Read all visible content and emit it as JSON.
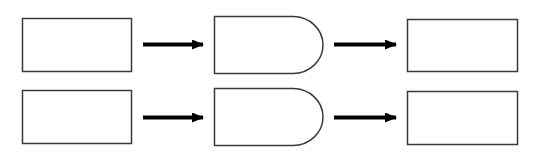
{
  "diagram": {
    "type": "flow",
    "rows": [
      {
        "nodes": [
          {
            "shape": "rectangle",
            "label": ""
          },
          {
            "shape": "delay",
            "label": ""
          },
          {
            "shape": "rectangle",
            "label": ""
          }
        ],
        "edges": [
          {
            "from": 0,
            "to": 1,
            "style": "arrow"
          },
          {
            "from": 1,
            "to": 2,
            "style": "arrow"
          }
        ]
      },
      {
        "nodes": [
          {
            "shape": "rectangle",
            "label": ""
          },
          {
            "shape": "delay",
            "label": ""
          },
          {
            "shape": "rectangle",
            "label": ""
          }
        ],
        "edges": [
          {
            "from": 0,
            "to": 1,
            "style": "arrow"
          },
          {
            "from": 1,
            "to": 2,
            "style": "arrow"
          }
        ]
      }
    ],
    "colors": {
      "stroke": "#3a3a3a",
      "arrow": "#000000",
      "background": "#ffffff"
    }
  }
}
